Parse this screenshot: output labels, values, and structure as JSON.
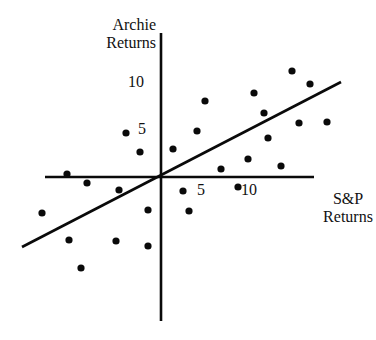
{
  "chart_data": {
    "type": "scatter",
    "title": "",
    "xlabel": "S&P Returns",
    "ylabel": "Archie Returns",
    "xlabel_lines": [
      "S&P",
      "Returns"
    ],
    "ylabel_lines": [
      "Archie",
      "Returns"
    ],
    "x_ticks": [
      5,
      10
    ],
    "y_ticks": [
      5,
      10
    ],
    "x_tick_labels": [
      "5",
      "10"
    ],
    "y_tick_labels": [
      "5",
      "10"
    ],
    "xlim": [
      -13,
      17
    ],
    "ylim": [
      -15,
      15
    ],
    "grid": false,
    "legend": null,
    "points": [
      {
        "x": 1.3,
        "y": 2.9
      },
      {
        "x": 4.9,
        "y": 8.0
      },
      {
        "x": 4.0,
        "y": 4.8
      },
      {
        "x": 6.7,
        "y": 0.8
      },
      {
        "x": 9.7,
        "y": 1.9
      },
      {
        "x": 10.3,
        "y": 8.9
      },
      {
        "x": 11.4,
        "y": 6.8
      },
      {
        "x": 11.9,
        "y": 4.1
      },
      {
        "x": 14.6,
        "y": 11.0
      },
      {
        "x": 16.6,
        "y": 9.7
      },
      {
        "x": 15.3,
        "y": 5.6
      },
      {
        "x": 18.4,
        "y": 5.7
      },
      {
        "x": 13.3,
        "y": 1.2
      },
      {
        "x": -3.9,
        "y": 4.6
      },
      {
        "x": -2.3,
        "y": 2.6
      },
      {
        "x": -10.4,
        "y": 0.3
      },
      {
        "x": -8.2,
        "y": -0.6
      },
      {
        "x": -4.7,
        "y": -1.4
      },
      {
        "x": -13.2,
        "y": -3.8
      },
      {
        "x": -10.2,
        "y": -6.6
      },
      {
        "x": -5.0,
        "y": -6.7
      },
      {
        "x": -1.4,
        "y": -3.5
      },
      {
        "x": -1.4,
        "y": -7.2
      },
      {
        "x": -8.9,
        "y": -9.6
      },
      {
        "x": 2.4,
        "y": -1.5
      },
      {
        "x": 3.1,
        "y": -3.6
      },
      {
        "x": 8.6,
        "y": -1.1
      }
    ],
    "regression_line": {
      "x": [
        -15.4,
        20.0
      ],
      "y": [
        -7.4,
        10.0
      ],
      "slope": 0.49,
      "intercept": 0.0
    }
  },
  "geometry": {
    "origin": [
      161,
      177
    ],
    "px_per_unit_x": 9.0,
    "px_per_unit_y": 9.5,
    "y_axis": {
      "x": 161,
      "y1": 33,
      "y2": 321
    },
    "x_axis": {
      "y": 177,
      "x1": 45,
      "x2": 314
    },
    "reg_line_px": {
      "x1": 22,
      "y1": 247,
      "x2": 341,
      "y2": 82
    },
    "x_tick_label_px": [
      [
        197,
        181
      ],
      [
        241,
        181
      ]
    ],
    "y_tick_label_px": [
      [
        138,
        120
      ],
      [
        128,
        73
      ]
    ],
    "points_px": [
      [
        173,
        149
      ],
      [
        205,
        101
      ],
      [
        197,
        131
      ],
      [
        221,
        169
      ],
      [
        248,
        159
      ],
      [
        254,
        93
      ],
      [
        264,
        113
      ],
      [
        268,
        138
      ],
      [
        292,
        71
      ],
      [
        310,
        84
      ],
      [
        299,
        123
      ],
      [
        327,
        122
      ],
      [
        281,
        166
      ],
      [
        126,
        133
      ],
      [
        140,
        152
      ],
      [
        67,
        174
      ],
      [
        87,
        183
      ],
      [
        119,
        190
      ],
      [
        42,
        213
      ],
      [
        69,
        240
      ],
      [
        116,
        241
      ],
      [
        148,
        210
      ],
      [
        148,
        246
      ],
      [
        81,
        268
      ],
      [
        183,
        191
      ],
      [
        189,
        211
      ],
      [
        238,
        187
      ]
    ],
    "dot_radius": 3.6,
    "stroke_color": "#0a0a0a"
  }
}
